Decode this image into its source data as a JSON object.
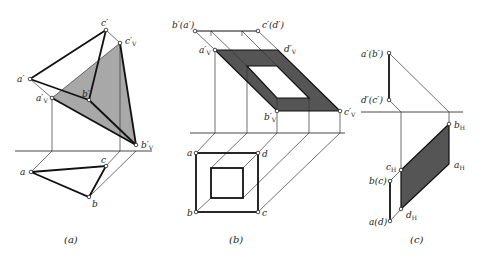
{
  "figure": {
    "captions": {
      "a": "(a)",
      "b": "(b)",
      "c": "(c)"
    },
    "colors": {
      "light_fill": "#a8a8a8",
      "dark_fill": "#555555",
      "line": "#111111"
    }
  },
  "panel_a": {
    "labels": {
      "c_prime": "c′",
      "cV": "c′",
      "cV_sub": "V",
      "a_prime": "a′",
      "aV": "a′",
      "aV_sub": "V",
      "b_prime": "b′",
      "bV": "b′",
      "bV_sub": "V",
      "a": "a",
      "b": "b",
      "c": "c"
    }
  },
  "panel_b": {
    "labels": {
      "ba_prime": "b′(a′)",
      "cd_prime": "c′(d′)",
      "aV": "a′",
      "aV_sub": "V",
      "dV": "d′",
      "dV_sub": "V",
      "bV": "b′",
      "bV_sub": "V",
      "cV": "c′",
      "cV_sub": "V",
      "a": "a",
      "b": "b",
      "c": "c",
      "d": "d"
    }
  },
  "panel_c": {
    "labels": {
      "ab_prime": "a′(b′)",
      "dc_prime": "d′(c′)",
      "bH": "b",
      "bH_sub": "H",
      "aH": "a",
      "aH_sub": "H",
      "cH": "c",
      "cH_sub": "H",
      "dH": "d",
      "dH_sub": "H",
      "bc": "b(c)",
      "ad": "a(d)"
    }
  }
}
